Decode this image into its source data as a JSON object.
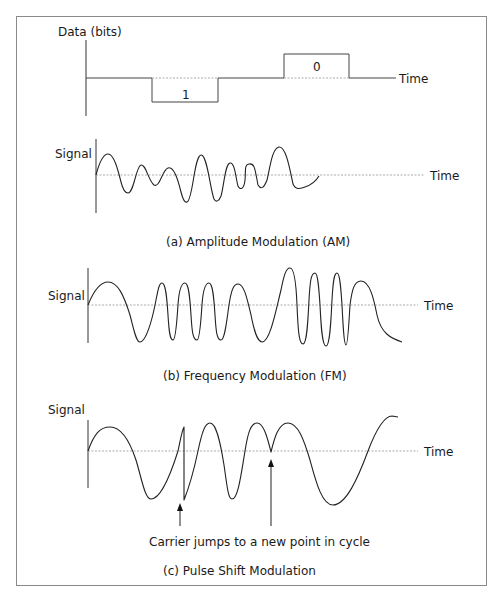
{
  "figure": {
    "panel_data_bits": {
      "y_axis_label": "Data (bits)",
      "x_axis_label": "Time",
      "bits": [
        {
          "value_label": "1",
          "level": "low"
        },
        {
          "value_label": "0",
          "level": "high"
        }
      ]
    },
    "panel_am": {
      "y_axis_label": "Signal",
      "x_axis_label": "Time",
      "caption": "(a) Amplitude Modulation (AM)"
    },
    "panel_fm": {
      "y_axis_label": "Signal",
      "x_axis_label": "Time",
      "caption": "(b) Frequency Modulation (FM)"
    },
    "panel_psm": {
      "y_axis_label": "Signal",
      "x_axis_label": "Time",
      "annotation": "Carrier jumps to a new point in cycle",
      "caption": "(c) Pulse Shift Modulation"
    }
  }
}
